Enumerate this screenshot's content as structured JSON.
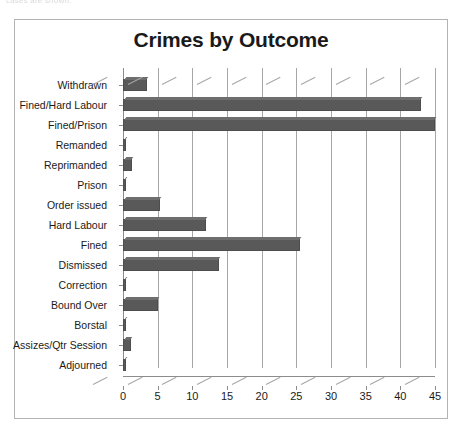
{
  "caption_fragment": "cases are shown.",
  "chart": {
    "title": "Crimes by Outcome"
  },
  "chart_data": {
    "type": "bar",
    "orientation": "horizontal",
    "title": "Crimes by Outcome",
    "xlabel": "",
    "ylabel": "",
    "xlim": [
      0,
      45
    ],
    "xticks": [
      0,
      5,
      10,
      15,
      20,
      25,
      30,
      35,
      40,
      45
    ],
    "grid": true,
    "legend": false,
    "bar_color": "#595959",
    "categories": [
      "Withdrawn",
      "Fined/Hard Labour",
      "Fined/Prison",
      "Remanded",
      "Reprimanded",
      "Prison",
      "Order issued",
      "Hard Labour",
      "Fined",
      "Dismissed",
      "Correction",
      "Bound Over",
      "Borstal",
      "Assizes/Qtr Session",
      "Adjourned"
    ],
    "values": [
      3.5,
      43,
      45,
      0.4,
      1.3,
      0.4,
      5.4,
      12,
      25.5,
      13.8,
      0.3,
      5,
      0.3,
      1.2,
      0.3
    ]
  }
}
